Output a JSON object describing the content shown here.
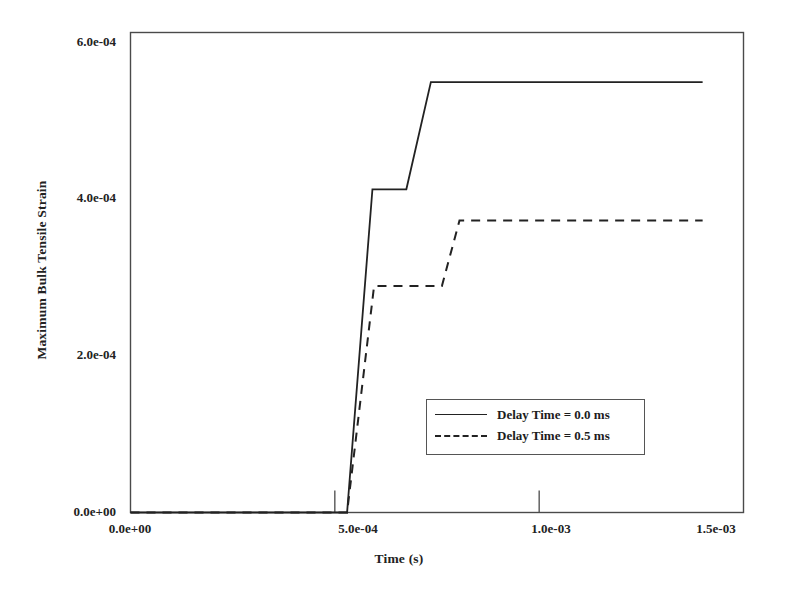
{
  "chart_data": {
    "type": "line",
    "title": "",
    "xlabel": "Time (s)",
    "ylabel": "Maximum Bulk Tensile Strain",
    "xlim": [
      0.0,
      0.0015
    ],
    "ylim": [
      0.0,
      0.0006
    ],
    "grid": false,
    "legend_position": "center-right-inside",
    "xticks": [
      {
        "value": 0.0,
        "label": "0.0e+00"
      },
      {
        "value": 0.0005,
        "label": "5.0e-04"
      },
      {
        "value": 0.001,
        "label": "1.0e-03"
      },
      {
        "value": 0.0015,
        "label": "1.5e-03"
      }
    ],
    "yticks": [
      {
        "value": 0.0,
        "label": "0.0e+00"
      },
      {
        "value": 0.0002,
        "label": "2.0e-04"
      },
      {
        "value": 0.0004,
        "label": "4.0e-04"
      },
      {
        "value": 0.0006,
        "label": "6.0e-04"
      }
    ],
    "series": [
      {
        "name": "Delay Time = 0.0 ms",
        "style": "solid",
        "color": "#222222",
        "points": [
          [
            0.0,
            0.0
          ],
          [
            0.00053,
            0.0
          ],
          [
            0.000592,
            0.000404
          ],
          [
            0.000675,
            0.000404
          ],
          [
            0.000735,
            0.000538
          ],
          [
            0.0014,
            0.000538
          ]
        ]
      },
      {
        "name": "Delay Time = 0.5 ms",
        "style": "dashed",
        "color": "#222222",
        "points": [
          [
            0.0,
            0.0
          ],
          [
            0.00053,
            0.0
          ],
          [
            0.000596,
            0.000283
          ],
          [
            0.000762,
            0.000283
          ],
          [
            0.000805,
            0.000365
          ],
          [
            0.0014,
            0.000365
          ]
        ]
      }
    ]
  },
  "legend": {
    "entries": [
      {
        "label": "Delay Time = 0.0 ms",
        "style": "solid"
      },
      {
        "label": "Delay Time = 0.5 ms",
        "style": "dashed"
      }
    ]
  }
}
